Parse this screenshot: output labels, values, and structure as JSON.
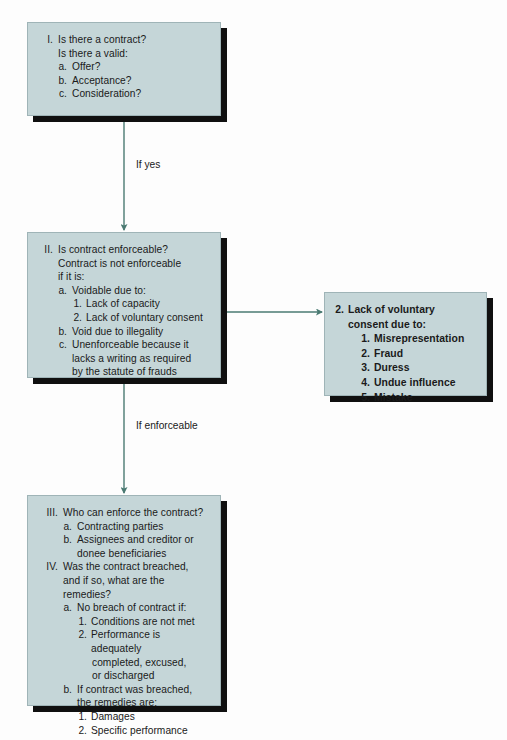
{
  "diagram": {
    "colors": {
      "background": "#fdfdfd",
      "box_fill": "#c5d6d8",
      "box_border": "#9fb4b7",
      "box_shadow": "#101010",
      "connector": "#4a7a72",
      "text": "#1a1a1a"
    }
  },
  "boxes": {
    "contract": {
      "name": "is-there-a-contract",
      "lines": [
        {
          "marker": "I.",
          "text": "Is there a contract?",
          "level": 0
        },
        {
          "marker": "",
          "text": "Is there a valid:",
          "level": "0c"
        },
        {
          "marker": "a.",
          "text": "Offer?",
          "level": 1
        },
        {
          "marker": "b.",
          "text": "Acceptance?",
          "level": 1
        },
        {
          "marker": "c.",
          "text": "Consideration?",
          "level": 1
        }
      ]
    },
    "enforceable": {
      "name": "is-contract-enforceable",
      "lines": [
        {
          "marker": "II.",
          "text": "Is contract enforceable?",
          "level": 0
        },
        {
          "marker": "",
          "text": "Contract is not enforceable",
          "level": "0c"
        },
        {
          "marker": "",
          "text": "if it is:",
          "level": "0c"
        },
        {
          "marker": "a.",
          "text": "Voidable due to:",
          "level": 1
        },
        {
          "marker": "1.",
          "text": "Lack of capacity",
          "level": 2
        },
        {
          "marker": "2.",
          "text": "Lack of voluntary consent",
          "level": 2
        },
        {
          "marker": "b.",
          "text": "Void due to illegality",
          "level": 1
        },
        {
          "marker": "c.",
          "text": "Unenforceable because it",
          "level": 1
        },
        {
          "marker": "",
          "text": "lacks a writing as required",
          "level": "1c"
        },
        {
          "marker": "",
          "text": "by the statute of frauds",
          "level": "1c"
        }
      ]
    },
    "voluntary_consent": {
      "name": "lack-of-voluntary-consent",
      "bold": true,
      "lines": [
        {
          "marker": "2.",
          "text": "Lack of voluntary",
          "level": 0
        },
        {
          "marker": "",
          "text": "consent due to:",
          "level": "0c"
        },
        {
          "marker": "1.",
          "text": "Misrepresentation",
          "level": 1
        },
        {
          "marker": "2.",
          "text": "Fraud",
          "level": 1
        },
        {
          "marker": "3.",
          "text": "Duress",
          "level": 1
        },
        {
          "marker": "4.",
          "text": "Undue influence",
          "level": 1
        },
        {
          "marker": "5.",
          "text": "Mistake",
          "level": 1
        }
      ]
    },
    "remedies": {
      "name": "who-can-enforce-and-remedies",
      "lines": [
        {
          "marker": "III.",
          "text": "Who can enforce the contract?",
          "level": 0
        },
        {
          "marker": "a.",
          "text": "Contracting parties",
          "level": 1
        },
        {
          "marker": "b.",
          "text": "Assignees and creditor or",
          "level": 1
        },
        {
          "marker": "",
          "text": "donee beneficiaries",
          "level": "1c"
        },
        {
          "marker": "IV.",
          "text": "Was the contract breached,",
          "level": 0
        },
        {
          "marker": "",
          "text": "and if so, what are the remedies?",
          "level": "0c"
        },
        {
          "marker": "a.",
          "text": "No breach of contract if:",
          "level": 1
        },
        {
          "marker": "1.",
          "text": "Conditions are not met",
          "level": 2
        },
        {
          "marker": "2.",
          "text": "Performance is adequately",
          "level": 2
        },
        {
          "marker": "",
          "text": "completed, excused,",
          "level": "2c"
        },
        {
          "marker": "",
          "text": "or discharged",
          "level": "2c"
        },
        {
          "marker": "b.",
          "text": "If contract was breached,",
          "level": 1
        },
        {
          "marker": "",
          "text": "the remedies are:",
          "level": "1c"
        },
        {
          "marker": "1.",
          "text": "Damages",
          "level": 2
        },
        {
          "marker": "2.",
          "text": "Specific performance",
          "level": 2
        }
      ]
    }
  },
  "connectors": {
    "if_yes": "If yes",
    "if_enforceable": "If enforceable"
  }
}
